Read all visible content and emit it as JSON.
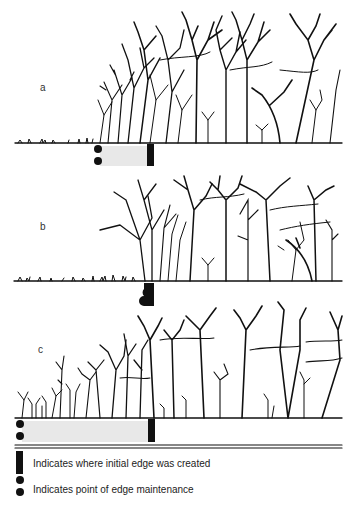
{
  "panels": [
    {
      "label": "a",
      "ground_y": 143,
      "maintenance_x": 98,
      "edge_x": 150,
      "treeline_start_x": 96
    },
    {
      "label": "b",
      "ground_y": 281,
      "maintenance_x": 148,
      "edge_x": 148,
      "treeline_start_x": 98
    },
    {
      "label": "c",
      "ground_y": 418,
      "maintenance_x": 20,
      "edge_x": 152,
      "treeline_start_x": 16
    }
  ],
  "legend": {
    "edge_created": "Indicates where initial edge was created",
    "edge_maintenance": "Indicates point of edge maintenance"
  }
}
